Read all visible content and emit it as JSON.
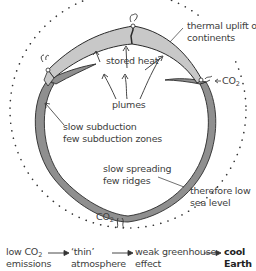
{
  "diagram": {
    "colors": {
      "continent_fill": "#c8c8c8",
      "ocean_plate_fill": "#8f8f8f",
      "outline": "#2a2a2a",
      "atmosphere_dots": "#333333",
      "text": "#404040"
    },
    "labels": {
      "thermal_uplift_1": "thermal uplift of",
      "thermal_uplift_2": "continents",
      "stored_heat": "stored heat",
      "co2_right": "CO",
      "co2_right_sub": "2",
      "plumes": "plumes",
      "slow_subduction_1": "slow subduction",
      "slow_subduction_2": "few subduction zones",
      "slow_spreading_1": "slow spreading",
      "slow_spreading_2": "few ridges",
      "sea_level_1": "therefore low",
      "sea_level_2": "sea level",
      "co2_bottom": "CO",
      "co2_bottom_sub": "2"
    },
    "flow_chain": [
      {
        "line1": "low CO",
        "sub": "2",
        "line2": "emissions"
      },
      {
        "line1": "‘thin’",
        "line2": "atmosphere"
      },
      {
        "line1": "weak greenhouse",
        "line2": "effect"
      },
      {
        "line1": "cool",
        "line2": "Earth"
      }
    ]
  }
}
